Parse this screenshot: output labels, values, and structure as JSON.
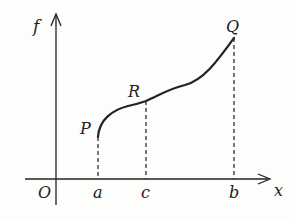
{
  "diagram": {
    "axes": {
      "y_label": "f",
      "x_label": "x",
      "origin_label": "O"
    },
    "points": [
      {
        "label": "P",
        "desc": "curve start at x=a"
      },
      {
        "label": "R",
        "desc": "curve point at x=c"
      },
      {
        "label": "Q",
        "desc": "curve end at x=b"
      }
    ],
    "ticks": [
      {
        "label": "a"
      },
      {
        "label": "c"
      },
      {
        "label": "b"
      }
    ],
    "colors": {
      "ink": "#222222",
      "background": "#fdfdfb"
    }
  }
}
